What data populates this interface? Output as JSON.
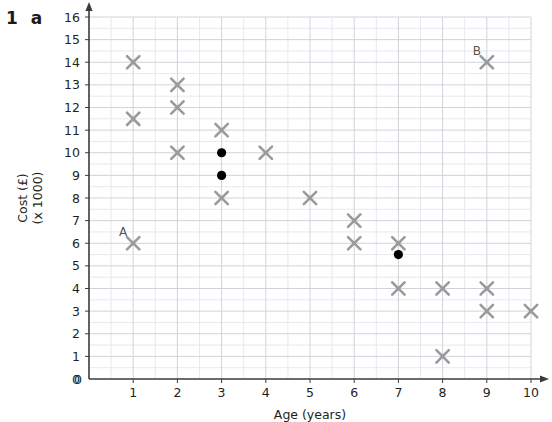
{
  "header": {
    "question_number": "1",
    "question_part": "a"
  },
  "chart_data": {
    "type": "scatter",
    "title": "",
    "xlabel": "Age (years)",
    "ylabel_line1": "Cost (£)",
    "ylabel_line2": "(x 1000)",
    "xlim": [
      0,
      10
    ],
    "ylim": [
      0,
      16
    ],
    "xticks": [
      "0",
      "1",
      "2",
      "3",
      "4",
      "5",
      "6",
      "7",
      "8",
      "9",
      "10"
    ],
    "yticks": [
      "0",
      "1",
      "2",
      "3",
      "4",
      "5",
      "6",
      "7",
      "8",
      "9",
      "10",
      "11",
      "12",
      "13",
      "14",
      "15",
      "16"
    ],
    "grid": true,
    "minor_grid": true,
    "legend": "none",
    "series": [
      {
        "name": "data",
        "marker": "cross",
        "color": "#9a9a9a",
        "points": [
          {
            "x": 1,
            "y": 14
          },
          {
            "x": 1,
            "y": 11.5
          },
          {
            "x": 1,
            "y": 6,
            "label": "A"
          },
          {
            "x": 2,
            "y": 13
          },
          {
            "x": 2,
            "y": 12
          },
          {
            "x": 2,
            "y": 10
          },
          {
            "x": 3,
            "y": 11
          },
          {
            "x": 3,
            "y": 8
          },
          {
            "x": 4,
            "y": 10
          },
          {
            "x": 5,
            "y": 8
          },
          {
            "x": 6,
            "y": 7
          },
          {
            "x": 6,
            "y": 6
          },
          {
            "x": 7,
            "y": 6
          },
          {
            "x": 7,
            "y": 4
          },
          {
            "x": 8,
            "y": 4
          },
          {
            "x": 8,
            "y": 1
          },
          {
            "x": 9,
            "y": 14,
            "label": "B"
          },
          {
            "x": 9,
            "y": 4
          },
          {
            "x": 9,
            "y": 3
          },
          {
            "x": 10,
            "y": 3
          }
        ]
      },
      {
        "name": "highlighted",
        "marker": "filled-circle",
        "color": "#000000",
        "points": [
          {
            "x": 3,
            "y": 10
          },
          {
            "x": 3,
            "y": 9
          },
          {
            "x": 7,
            "y": 5.5
          }
        ]
      }
    ],
    "annotations": [
      {
        "text": "A",
        "x": 1,
        "y": 6
      },
      {
        "text": "B",
        "x": 9,
        "y": 14
      }
    ]
  },
  "colors": {
    "marker_gray": "#9a9a9a",
    "marker_black": "#000000",
    "grid_major": "#d2d2dc",
    "grid_minor": "#e8e8ef",
    "axis": "#3b3b3b",
    "text": "#231f20"
  }
}
